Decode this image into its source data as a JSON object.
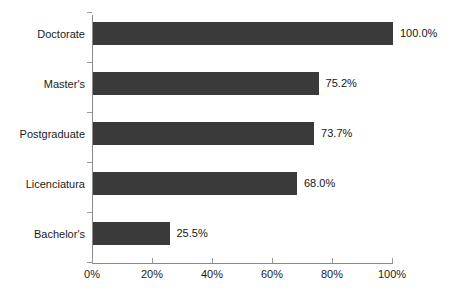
{
  "chart_data": {
    "type": "bar",
    "orientation": "horizontal",
    "title": "",
    "xlabel": "",
    "ylabel": "",
    "categories": [
      "Doctorate",
      "Master's",
      "Postgraduate",
      "Licenciatura",
      "Bachelor's"
    ],
    "values": [
      100.0,
      75.2,
      73.7,
      68.0,
      25.5
    ],
    "data_labels": [
      "100.0%",
      "75.2%",
      "73.7%",
      "68.0%",
      "25.5%"
    ],
    "xlim": [
      0,
      100
    ],
    "xticks": [
      0,
      20,
      40,
      60,
      80,
      100
    ],
    "xtick_labels": [
      "0%",
      "20%",
      "40%",
      "60%",
      "80%",
      "100%"
    ],
    "grid": false,
    "legend": false,
    "bar_color": "#3a3a3a",
    "axis_color": "#8a8a8a",
    "background_color": "#ffffff",
    "text_color": "#1b1b1b"
  },
  "artifacts": {
    "top_smudge": "",
    "bottom_smudge": ""
  }
}
